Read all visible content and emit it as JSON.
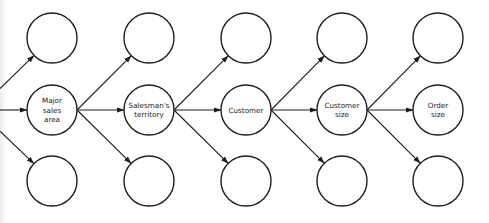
{
  "diagram": {
    "type": "tree-flow",
    "colors": {
      "stroke": "#1e1e1e",
      "background": "#ffffff",
      "text": "#222222"
    },
    "columns": [
      {
        "x": 52,
        "nodes": [
          {
            "id": "c1-top",
            "label": []
          },
          {
            "id": "c1-mid",
            "label": [
              "Major",
              "sales",
              "area"
            ]
          },
          {
            "id": "c1-bot",
            "label": []
          }
        ]
      },
      {
        "x": 149,
        "nodes": [
          {
            "id": "c2-top",
            "label": []
          },
          {
            "id": "c2-mid",
            "label": [
              "Salesman's",
              "territory"
            ]
          },
          {
            "id": "c2-bot",
            "label": []
          }
        ]
      },
      {
        "x": 246,
        "nodes": [
          {
            "id": "c3-top",
            "label": []
          },
          {
            "id": "c3-mid",
            "label": [
              "Customer"
            ]
          },
          {
            "id": "c3-bot",
            "label": []
          }
        ]
      },
      {
        "x": 342,
        "nodes": [
          {
            "id": "c4-top",
            "label": []
          },
          {
            "id": "c4-mid",
            "label": [
              "Customer",
              "size"
            ]
          },
          {
            "id": "c4-bot",
            "label": []
          }
        ]
      },
      {
        "x": 438,
        "nodes": [
          {
            "id": "c5-top",
            "label": []
          },
          {
            "id": "c5-mid",
            "label": [
              "Order",
              "size"
            ]
          },
          {
            "id": "c5-bot",
            "label": []
          }
        ]
      }
    ],
    "rows_y": [
      38,
      110,
      181
    ],
    "radius": 25,
    "incoming_from_left": true
  }
}
